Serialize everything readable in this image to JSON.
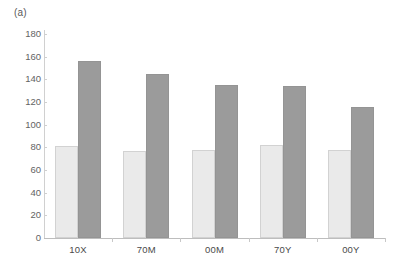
{
  "figure": {
    "panel_label": "(a)",
    "background_color": "#ffffff"
  },
  "chart_data": {
    "type": "bar",
    "title": "",
    "subtitle": "",
    "xlabel": "",
    "ylabel": "",
    "ylim": [
      0,
      180
    ],
    "yticks": [
      0,
      20,
      40,
      60,
      80,
      100,
      120,
      140,
      160,
      180
    ],
    "ytick_labels": [
      "0",
      "20",
      "40",
      "60",
      "80",
      "100",
      "120",
      "140",
      "160",
      "180"
    ],
    "grid": false,
    "legend": null,
    "categories": [
      "10X",
      "70M",
      "00M",
      "70Y",
      "00Y"
    ],
    "series": [
      {
        "name": "series-1",
        "color": "#eaeaea",
        "border_color": "#d2d2d2",
        "values": [
          81,
          77,
          78,
          82,
          78
        ]
      },
      {
        "name": "series-2",
        "color": "#9b9b9b",
        "border_color": "#949494",
        "values": [
          156,
          145,
          135,
          134,
          116
        ]
      }
    ],
    "annotations": [
      "(a)"
    ]
  }
}
